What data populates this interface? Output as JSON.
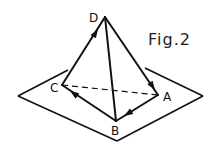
{
  "figure": {
    "caption": "Fig.2",
    "vertices": {
      "A": "A",
      "B": "B",
      "C": "C",
      "D": "D"
    },
    "edges": [
      {
        "from": "C",
        "to": "D",
        "style": "solid",
        "arrow": "toward D"
      },
      {
        "from": "D",
        "to": "A",
        "style": "solid",
        "arrow": "toward A"
      },
      {
        "from": "A",
        "to": "B",
        "style": "solid",
        "arrow": "toward B"
      },
      {
        "from": "B",
        "to": "C",
        "style": "solid",
        "arrow": "toward C"
      },
      {
        "from": "D",
        "to": "B",
        "style": "solid",
        "arrow": "none"
      },
      {
        "from": "C",
        "to": "A",
        "style": "dashed",
        "arrow": "none"
      }
    ],
    "plane": "rhombus base plane",
    "colors": {
      "stroke": "#111111",
      "background": "#ffffff"
    }
  }
}
